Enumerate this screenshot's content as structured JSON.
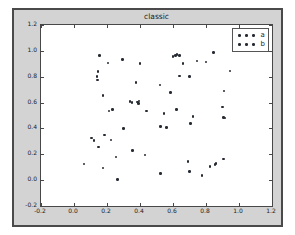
{
  "figure": {
    "title": "classic",
    "facecolor": "#d3d3d3",
    "axes_facecolor": "#ffffff",
    "edgecolor": "#4a4a4a",
    "marker_color": "#262a33"
  },
  "legend": {
    "position": "upper right",
    "entries": [
      {
        "label": "a",
        "marker": "point",
        "color": "#262a33"
      },
      {
        "label": "b",
        "marker": "point",
        "color": "#262a33"
      }
    ]
  },
  "chart_data": {
    "type": "scatter",
    "title": "classic",
    "xlabel": "",
    "ylabel": "",
    "xlim": [
      -0.2,
      1.2
    ],
    "ylim": [
      -0.2,
      1.2
    ],
    "xticks": [
      -0.2,
      0.0,
      0.2,
      0.4,
      0.6,
      0.8,
      1.0,
      1.2
    ],
    "yticks": [
      -0.2,
      0.0,
      0.2,
      0.4,
      0.6,
      0.8,
      1.0,
      1.2
    ],
    "xticklabels": [
      "-0.2",
      "0.0",
      "0.2",
      "0.4",
      "0.6",
      "0.8",
      "1.0",
      "1.2"
    ],
    "yticklabels": [
      "-0.2",
      "0.0",
      "0.2",
      "0.4",
      "0.6",
      "0.8",
      "1.0",
      "1.2"
    ],
    "grid": false,
    "legend_position": "upper right",
    "marker": "point",
    "series": [
      {
        "name": "a",
        "color": "#262a33",
        "points": [
          [
            0.155,
            0.965
          ],
          [
            0.205,
            0.905
          ],
          [
            0.295,
            0.935
          ],
          [
            0.4,
            0.9
          ],
          [
            0.145,
            0.84
          ],
          [
            0.14,
            0.8
          ],
          [
            0.142,
            0.775
          ],
          [
            0.375,
            0.755
          ],
          [
            0.175,
            0.655
          ],
          [
            0.34,
            0.61
          ],
          [
            0.352,
            0.6
          ],
          [
            0.385,
            0.605
          ],
          [
            0.392,
            0.595
          ],
          [
            0.395,
            0.612
          ],
          [
            0.235,
            0.545
          ],
          [
            0.212,
            0.535
          ],
          [
            0.44,
            0.535
          ],
          [
            0.3,
            0.4
          ],
          [
            0.185,
            0.35
          ],
          [
            0.225,
            0.31
          ],
          [
            0.105,
            0.325
          ],
          [
            0.12,
            0.305
          ],
          [
            0.148,
            0.255
          ],
          [
            0.355,
            0.23
          ],
          [
            0.255,
            0.18
          ],
          [
            0.175,
            0.095
          ],
          [
            0.06,
            0.125
          ],
          [
            0.265,
            0.005
          ],
          [
            0.43,
            0.195
          ],
          [
            0.525,
            0.415
          ],
          [
            0.56,
            0.405
          ],
          [
            0.545,
            0.515
          ],
          [
            0.52,
            0.735
          ],
          [
            0.585,
            0.68
          ],
          [
            0.525,
            0.05
          ]
        ]
      },
      {
        "name": "b",
        "color": "#262a33",
        "points": [
          [
            0.6,
            0.955
          ],
          [
            0.615,
            0.962
          ],
          [
            0.625,
            0.97
          ],
          [
            0.638,
            0.965
          ],
          [
            0.66,
            0.9
          ],
          [
            0.64,
            0.805
          ],
          [
            0.7,
            0.8
          ],
          [
            0.745,
            0.92
          ],
          [
            0.8,
            0.915
          ],
          [
            0.845,
            0.985
          ],
          [
            0.62,
            0.545
          ],
          [
            0.705,
            0.44
          ],
          [
            0.72,
            0.49
          ],
          [
            0.945,
            0.845
          ],
          [
            0.91,
            0.69
          ],
          [
            0.9,
            0.565
          ],
          [
            0.905,
            0.485
          ],
          [
            0.915,
            0.48
          ],
          [
            0.69,
            0.145
          ],
          [
            0.7,
            0.065
          ],
          [
            0.775,
            0.035
          ],
          [
            0.825,
            0.105
          ],
          [
            0.855,
            0.12
          ],
          [
            0.86,
            0.13
          ],
          [
            0.905,
            0.165
          ]
        ]
      }
    ]
  }
}
